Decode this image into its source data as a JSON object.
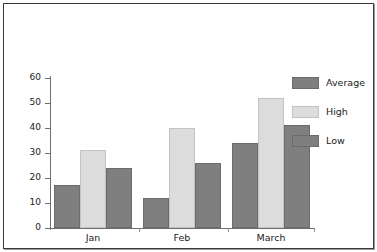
{
  "chart_data": {
    "type": "bar",
    "title": "",
    "xlabel": "",
    "ylabel": "",
    "categories": [
      "Jan",
      "Feb",
      "March"
    ],
    "series": [
      {
        "name": "Average",
        "values": [
          17,
          12,
          34
        ],
        "color": "#7f7f7f"
      },
      {
        "name": "High",
        "values": [
          31,
          40,
          52
        ],
        "color": "#dcdcdc"
      },
      {
        "name": "Low",
        "values": [
          24,
          26,
          41
        ],
        "color": "#7f7f7f"
      }
    ],
    "ylim": [
      0,
      60
    ],
    "ytick_labels": [
      "0",
      "10",
      "20",
      "30",
      "40",
      "50",
      "60"
    ],
    "ytick_values": [
      0,
      10,
      20,
      30,
      40,
      50,
      60
    ],
    "grid": false,
    "legend_position": "right",
    "legend_entries": [
      "Average",
      "High",
      "Low"
    ]
  },
  "axes": {
    "y_labels": {
      "t0": "0",
      "t10": "10",
      "t20": "20",
      "t30": "30",
      "t40": "40",
      "t50": "50",
      "t60": "60"
    },
    "x_labels": {
      "g0": "Jan",
      "g1": "Feb",
      "g2": "March"
    }
  },
  "legend": {
    "rows": [
      {
        "label": "Average",
        "color": "#7f7f7f"
      },
      {
        "label": "High",
        "color": "#dcdcdc"
      },
      {
        "label": "Low",
        "color": "#7f7f7f"
      }
    ]
  },
  "colors": {
    "average": "#7f7f7f",
    "high": "#dcdcdc",
    "low": "#7f7f7f",
    "axis": "#6e6e6e",
    "text": "#1b1b1b",
    "frame": "#3a3a3a",
    "background": "#ffffff"
  }
}
